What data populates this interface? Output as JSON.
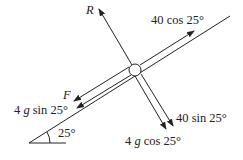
{
  "diagram": {
    "incline_angle_label": "25°",
    "forces": [
      {
        "id": "R",
        "label_italic": "R",
        "label_rest": "",
        "direction": "perpendicular, away from plane"
      },
      {
        "id": "pull",
        "label_italic": "",
        "label_rest": "40 cos 25°",
        "direction": "up the slope"
      },
      {
        "id": "F",
        "label_italic": "F",
        "label_rest": "",
        "direction": "down the slope"
      },
      {
        "id": "weight_parallel",
        "label_pre": "4 ",
        "label_italic": "g",
        "label_rest": " sin 25°",
        "direction": "down the slope"
      },
      {
        "id": "pull_perp",
        "label_italic": "",
        "label_rest": "40 sin 25°",
        "direction": "perpendicular, into plane"
      },
      {
        "id": "weight_perp",
        "label_pre": "4 ",
        "label_italic": "g",
        "label_rest": " cos 25°",
        "direction": "perpendicular, into plane"
      }
    ],
    "colors": {
      "stroke": "#222222",
      "background": "#ffffff"
    }
  }
}
